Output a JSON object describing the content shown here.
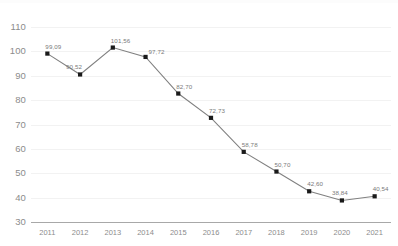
{
  "chart_data": {
    "type": "line",
    "title": "",
    "subtitle": "",
    "xlabel": "",
    "ylabel": "",
    "categories": [
      "2011",
      "2012",
      "2013",
      "2014",
      "2015",
      "2016",
      "2017",
      "2018",
      "2019",
      "2020",
      "2021"
    ],
    "values": [
      99.09,
      90.52,
      101.56,
      97.72,
      82.7,
      72.73,
      58.78,
      50.7,
      42.6,
      38.84,
      40.54
    ],
    "data_labels": [
      "99,09",
      "90,52",
      "101,56",
      "97,72",
      "82,70",
      "72,73",
      "58,78",
      "50,70",
      "42,60",
      "38,84",
      "40,54"
    ],
    "ylim": [
      30,
      110
    ],
    "yticks": [
      110,
      100,
      90,
      80,
      70,
      60,
      50,
      40,
      30
    ],
    "ytick_labels": [
      "110",
      "100",
      "90",
      "80",
      "70",
      "60",
      "50",
      "40",
      "30"
    ],
    "grid": true,
    "legend": false,
    "legend_position": "none",
    "marker": "square",
    "decimal_separator": ",",
    "series": [
      {
        "name": "series-1",
        "values": [
          99.09,
          90.52,
          101.56,
          97.72,
          82.7,
          72.73,
          58.78,
          50.7,
          42.6,
          38.84,
          40.54
        ]
      }
    ]
  },
  "style": {
    "line_color": "#808080",
    "marker_color": "#1a1a1a",
    "grid_color": "#f2f2f2",
    "axis_color": "#a8a8a8",
    "tick_text_color": "#8c8c8c",
    "label_text_color": "#7a7a7a",
    "background": "#ffffff"
  }
}
